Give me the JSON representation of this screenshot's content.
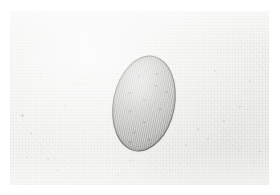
{
  "figure": {
    "kind": "micrograph",
    "caption": "",
    "width": 280,
    "height": 195,
    "background_color": "#f2f2f0",
    "margin_color": "#ffffff"
  },
  "specimen": {
    "name": "ovum",
    "shape": "ellipse",
    "outline_color": "#4a4a48",
    "fill_color": "#b4b4b1",
    "center_x": 134,
    "center_y": 92,
    "width": 62,
    "height": 97,
    "rotation_deg": 11,
    "granules": [
      {
        "x": 20,
        "y": 22,
        "d": 2
      },
      {
        "x": 37,
        "y": 16,
        "d": 1.6
      },
      {
        "x": 30,
        "y": 44,
        "d": 2.2
      },
      {
        "x": 47,
        "y": 50,
        "d": 1.8
      },
      {
        "x": 18,
        "y": 58,
        "d": 2
      },
      {
        "x": 34,
        "y": 66,
        "d": 1.5
      },
      {
        "x": 26,
        "y": 78,
        "d": 2.4
      },
      {
        "x": 42,
        "y": 82,
        "d": 1.6
      },
      {
        "x": 14,
        "y": 40,
        "d": 1.4
      },
      {
        "x": 50,
        "y": 32,
        "d": 1.5
      },
      {
        "x": 24,
        "y": 88,
        "d": 1.7
      },
      {
        "x": 38,
        "y": 28,
        "d": 1.3
      }
    ]
  },
  "background_specks": [
    {
      "x": 12,
      "y": 104,
      "d": 3.0,
      "o": 0.4
    },
    {
      "x": 21,
      "y": 122,
      "d": 2.2,
      "o": 0.3
    },
    {
      "x": 17,
      "y": 146,
      "d": 2.0,
      "o": 0.26
    },
    {
      "x": 70,
      "y": 72,
      "d": 2.6,
      "o": 0.34
    },
    {
      "x": 76,
      "y": 66,
      "d": 1.8,
      "o": 0.24
    },
    {
      "x": 55,
      "y": 95,
      "d": 2.0,
      "o": 0.22
    },
    {
      "x": 90,
      "y": 57,
      "d": 2.2,
      "o": 0.3
    },
    {
      "x": 38,
      "y": 148,
      "d": 2.4,
      "o": 0.28
    },
    {
      "x": 47,
      "y": 160,
      "d": 1.8,
      "o": 0.2
    },
    {
      "x": 120,
      "y": 150,
      "d": 2.0,
      "o": 0.22
    },
    {
      "x": 188,
      "y": 118,
      "d": 2.6,
      "o": 0.3
    },
    {
      "x": 198,
      "y": 128,
      "d": 2.0,
      "o": 0.24
    },
    {
      "x": 176,
      "y": 134,
      "d": 2.2,
      "o": 0.26
    },
    {
      "x": 214,
      "y": 110,
      "d": 1.8,
      "o": 0.22
    },
    {
      "x": 230,
      "y": 96,
      "d": 2.4,
      "o": 0.28
    },
    {
      "x": 240,
      "y": 70,
      "d": 2.0,
      "o": 0.22
    },
    {
      "x": 205,
      "y": 60,
      "d": 1.6,
      "o": 0.18
    },
    {
      "x": 150,
      "y": 26,
      "d": 1.8,
      "o": 0.2
    },
    {
      "x": 96,
      "y": 18,
      "d": 1.6,
      "o": 0.18
    },
    {
      "x": 250,
      "y": 140,
      "d": 2.0,
      "o": 0.22
    },
    {
      "x": 244,
      "y": 152,
      "d": 1.6,
      "o": 0.18
    },
    {
      "x": 64,
      "y": 28,
      "d": 1.6,
      "o": 0.16
    },
    {
      "x": 160,
      "y": 160,
      "d": 1.8,
      "o": 0.2
    },
    {
      "x": 108,
      "y": 164,
      "d": 1.6,
      "o": 0.18
    },
    {
      "x": 30,
      "y": 66,
      "d": 1.8,
      "o": 0.22
    }
  ]
}
